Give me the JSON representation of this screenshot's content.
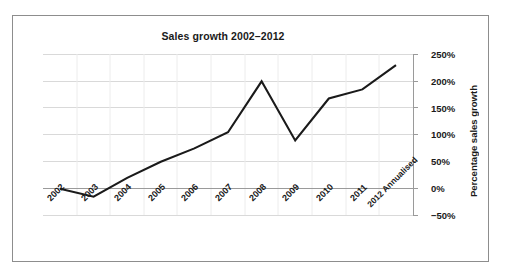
{
  "chart_data": {
    "type": "line",
    "title": "Sales growth 2002–2012",
    "xlabel": "",
    "ylabel": "Percentage sales growth",
    "categories": [
      "2002",
      "2003",
      "2004",
      "2005",
      "2006",
      "2007",
      "2008",
      "2009",
      "2010",
      "2011",
      "2012 Annualised"
    ],
    "values": [
      0,
      -15,
      20,
      50,
      75,
      105,
      200,
      90,
      168,
      185,
      230
    ],
    "ylim": [
      -50,
      250
    ],
    "ytick_labels": [
      "250%",
      "200%",
      "150%",
      "100%",
      "50%",
      "0%",
      "−50%"
    ],
    "ytick_values": [
      250,
      200,
      150,
      100,
      50,
      0,
      -50
    ],
    "grid": true,
    "legend": false,
    "series_color": "#1a1a1a",
    "gridline_color": "#d9d9d9",
    "axis_color": "#9a9a9a"
  },
  "figure": {
    "frame_border_color": "#8d8d8d",
    "background": "#ffffff"
  }
}
